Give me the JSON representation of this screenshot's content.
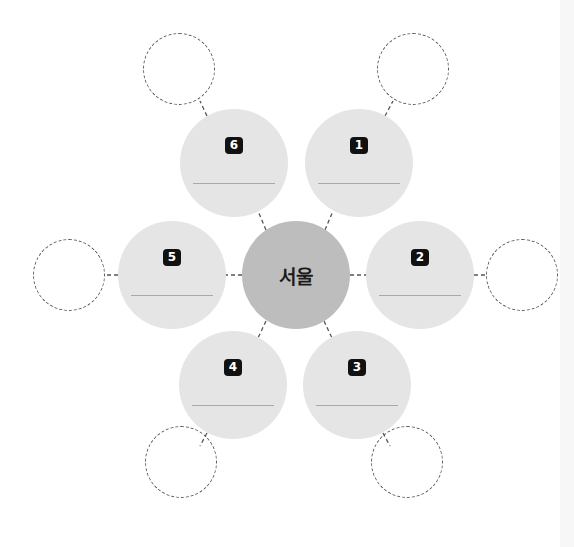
{
  "diagram": {
    "type": "mind-map",
    "center": {
      "label": "서울",
      "color": "#bdbdbd"
    },
    "petal_color": "#e5e5e5",
    "petals": [
      {
        "number": "1",
        "text": ""
      },
      {
        "number": "2",
        "text": ""
      },
      {
        "number": "3",
        "text": ""
      },
      {
        "number": "4",
        "text": ""
      },
      {
        "number": "5",
        "text": ""
      },
      {
        "number": "6",
        "text": ""
      }
    ],
    "outer_nodes": [
      {
        "for": "1",
        "text": ""
      },
      {
        "for": "2",
        "text": ""
      },
      {
        "for": "3",
        "text": ""
      },
      {
        "for": "4",
        "text": ""
      },
      {
        "for": "5",
        "text": ""
      },
      {
        "for": "6",
        "text": ""
      }
    ]
  }
}
